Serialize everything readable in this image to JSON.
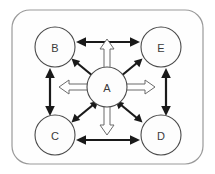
{
  "diagram": {
    "frame": {
      "name": "outer-boundary",
      "shape": "rounded-rectangle",
      "stroke_color": "#9a9a9a",
      "fill_color": "#fefefe"
    },
    "nodes": [
      {
        "id": "A",
        "label": "A",
        "role": "center-hub",
        "cx": 107,
        "cy": 87,
        "r": 20
      },
      {
        "id": "B",
        "label": "B",
        "role": "top-left",
        "cx": 55,
        "cy": 47,
        "r": 20
      },
      {
        "id": "E",
        "label": "E",
        "role": "top-right",
        "cx": 161,
        "cy": 47,
        "r": 20
      },
      {
        "id": "C",
        "label": "C",
        "role": "bottom-left",
        "cx": 55,
        "cy": 135,
        "r": 20
      },
      {
        "id": "D",
        "label": "D",
        "role": "bottom-right",
        "cx": 161,
        "cy": 135,
        "r": 20
      }
    ],
    "connections": [
      {
        "from": "B",
        "to": "E",
        "style": "solid-black",
        "heads": "both",
        "position": "top-edge"
      },
      {
        "from": "C",
        "to": "D",
        "style": "solid-black",
        "heads": "both",
        "position": "bottom-edge"
      },
      {
        "from": "B",
        "to": "C",
        "style": "solid-black",
        "heads": "both",
        "position": "left-edge"
      },
      {
        "from": "E",
        "to": "D",
        "style": "solid-black",
        "heads": "both",
        "position": "right-edge"
      },
      {
        "from": "A",
        "to": "B",
        "style": "solid-black",
        "heads": "both",
        "position": "diagonal-upper-left"
      },
      {
        "from": "A",
        "to": "E",
        "style": "solid-black",
        "heads": "both",
        "position": "diagonal-upper-right"
      },
      {
        "from": "A",
        "to": "C",
        "style": "solid-black",
        "heads": "both",
        "position": "diagonal-lower-left"
      },
      {
        "from": "A",
        "to": "D",
        "style": "solid-black",
        "heads": "both",
        "position": "diagonal-lower-right"
      },
      {
        "from": "A",
        "to": "top-edge",
        "style": "hollow-outline",
        "heads": "single",
        "position": "up"
      },
      {
        "from": "A",
        "to": "bottom-edge",
        "style": "hollow-outline",
        "heads": "single",
        "position": "down"
      },
      {
        "from": "A",
        "to": "left-edge",
        "style": "hollow-outline",
        "heads": "single",
        "position": "left"
      },
      {
        "from": "A",
        "to": "right-edge",
        "style": "hollow-outline",
        "heads": "single",
        "position": "right"
      }
    ],
    "colors": {
      "solid_arrow": "#1a1a1a",
      "hollow_arrow_stroke": "#6b6b6b",
      "hollow_arrow_fill": "#ffffff",
      "node_stroke": "#4a4a4a",
      "frame_stroke": "#9a9a9a",
      "label_text": "#3a3a3a"
    }
  }
}
